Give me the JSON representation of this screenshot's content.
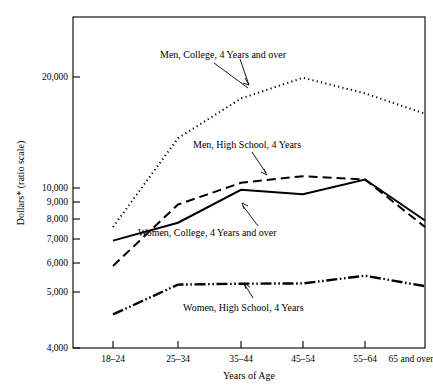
{
  "chart_data": {
    "type": "line",
    "title": "",
    "xlabel": "Years of Age",
    "ylabel": "Dollars* (ratio scale)",
    "scale": "log",
    "grid": false,
    "legend_position": "inline-annotations",
    "categories": [
      "18–24",
      "25–34",
      "35–44",
      "45–54",
      "55–64",
      "65 and over"
    ],
    "ylim": [
      4000,
      24000
    ],
    "yticks": [
      4000,
      5000,
      6000,
      7000,
      8000,
      9000,
      10000,
      20000
    ],
    "ytick_labels": [
      "4,000",
      "5,000",
      "6,000",
      "7,000",
      "8,000",
      "9,000",
      "10,000",
      "20,000"
    ],
    "series": [
      {
        "name": "Men, College, 4 Years and over",
        "style": "dotted",
        "values": [
          8000,
          13300,
          16700,
          18800,
          17200,
          15300
        ]
      },
      {
        "name": "Men, High School, 4 Years",
        "style": "dashed",
        "values": [
          6400,
          9100,
          10300,
          10700,
          10500,
          8000
        ]
      },
      {
        "name": "Women, College, 4 Years and over",
        "style": "solid",
        "values": [
          7400,
          8200,
          9900,
          9650,
          10500,
          8300
        ]
      },
      {
        "name": "Women, High School, 4 Years",
        "style": "dash-dot-dot",
        "values": [
          4850,
          5750,
          5780,
          5790,
          6050,
          5700
        ]
      }
    ],
    "annotations": [
      {
        "text": "Men, College, 4 Years and over",
        "series": "Men, College, 4 Years and over"
      },
      {
        "text": "Men, High School, 4 Years",
        "series": "Men, High School, 4 Years"
      },
      {
        "text": "Women, College, 4 Years and over",
        "series": "Women, College, 4 Years and over"
      },
      {
        "text": "Women, High School, 4 Years",
        "series": "Women, High School, 4 Years"
      }
    ]
  },
  "axes": {
    "y_title": "Dollars* (ratio scale)",
    "x_title": "Years of Age",
    "ytick_labels": {
      "t20000": "20,000",
      "t10000": "10,000",
      "t9000": "9,000",
      "t8000": "8,000",
      "t7000": "7,000",
      "t6000": "6,000",
      "t5000": "5,000",
      "t4000": "4,000"
    },
    "xtick_labels": {
      "c0": "18–24",
      "c1": "25–34",
      "c2": "35–44",
      "c3": "45–54",
      "c4": "55–64",
      "c5": "65 and over"
    }
  },
  "annotations": {
    "men_college": "Men, College, 4 Years and over",
    "men_highschool": "Men, High School, 4 Years",
    "women_college": "Women, College, 4 Years and over",
    "women_highschool": "Women, High School, 4 Years"
  },
  "colors": {
    "ink": "#000000",
    "paper": "#ffffff"
  }
}
